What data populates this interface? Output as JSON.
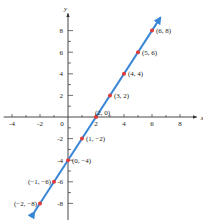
{
  "chart_data": {
    "type": "line",
    "title": "",
    "xlabel": "x",
    "ylabel": "y",
    "xlim": [
      -4.6,
      9.2
    ],
    "ylim": [
      -9.6,
      9.6
    ],
    "grid": false,
    "x_ticks": [
      -4,
      -2,
      0,
      2,
      4,
      6,
      8
    ],
    "x_tick_labels": [
      "-4",
      "-2",
      "0",
      "2",
      "4",
      "6",
      "8"
    ],
    "y_ticks": [
      -8,
      -6,
      -4,
      -2,
      2,
      4,
      6,
      8
    ],
    "y_tick_labels": [
      "-8",
      "-6",
      "-4",
      "-2",
      "2",
      "4",
      "6",
      "8"
    ],
    "line": {
      "slope": 2,
      "intercept": -4,
      "x_range": [
        -2.4,
        6.6
      ],
      "color": "#3a86d6",
      "arrows": "both"
    },
    "points": [
      {
        "x": -2,
        "y": -8,
        "label": "(−2, −8)",
        "side": "left"
      },
      {
        "x": -1,
        "y": -6,
        "label": "(−1, −6)",
        "side": "left"
      },
      {
        "x": 0,
        "y": -4,
        "label": "(0, −4)",
        "side": "right"
      },
      {
        "x": 1,
        "y": -2,
        "label": "(1, −2)",
        "side": "right"
      },
      {
        "x": 2,
        "y": 0,
        "label": "(2, 0)",
        "side": "right-up"
      },
      {
        "x": 3,
        "y": 2,
        "label": "(3, 2)",
        "side": "right"
      },
      {
        "x": 4,
        "y": 4,
        "label": "(4, 4)",
        "side": "right"
      },
      {
        "x": 5,
        "y": 6,
        "label": "(5, 6)",
        "side": "right"
      },
      {
        "x": 6,
        "y": 8,
        "label": "(6, 8)",
        "side": "right"
      }
    ],
    "point_color": "#e03a3a",
    "axis_color": "#333333"
  }
}
